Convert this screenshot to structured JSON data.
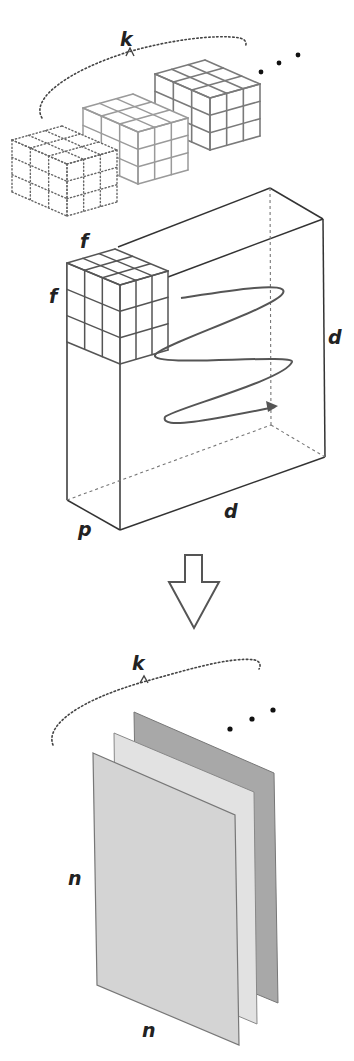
{
  "diagram": {
    "labels": {
      "filters_count_top": "k",
      "filter_size_top": "f",
      "filter_size_side": "f",
      "input_height": "d",
      "input_width": "d",
      "input_depth": "p",
      "maps_count": "k",
      "map_height": "n",
      "map_width": "n"
    },
    "ellipsis": "• • •",
    "colors": {
      "stroke": "#555555",
      "dark_stroke": "#333333",
      "cube_gray": "#8a8a8a",
      "map_front": "#d4d4d4",
      "map_middle": "#e2e2e2",
      "map_back": "#a8a8a8",
      "arrow_outline": "#555555"
    }
  }
}
